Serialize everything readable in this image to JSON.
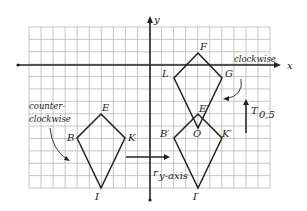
{
  "axes": {
    "x_label": "x",
    "y_label": "y"
  },
  "grid": {
    "left": 29,
    "right": 270,
    "top": 27,
    "bottom": 188,
    "cell": 12,
    "origin_x": 150,
    "origin_y": 65,
    "line_color": "#b8b8b8"
  },
  "figures": {
    "original": {
      "vertices": [
        {
          "name": "E",
          "x": 101,
          "y": 114
        },
        {
          "name": "K",
          "x": 125,
          "y": 138
        },
        {
          "name": "I",
          "x": 101,
          "y": 188
        },
        {
          "name": "B",
          "x": 77,
          "y": 138
        }
      ]
    },
    "reflected": {
      "vertices": [
        {
          "name": "F",
          "x": 198,
          "y": 53
        },
        {
          "name": "G",
          "x": 222,
          "y": 78
        },
        {
          "name": "E'",
          "x": 198,
          "y": 128
        },
        {
          "name": "L",
          "x": 174,
          "y": 78
        }
      ]
    },
    "translated": {
      "vertices": [
        {
          "name": "E'",
          "x": 198,
          "y": 114
        },
        {
          "name": "K'",
          "x": 222,
          "y": 138
        },
        {
          "name": "I'",
          "x": 198,
          "y": 188
        },
        {
          "name": "B'",
          "x": 174,
          "y": 138
        }
      ]
    }
  },
  "labels": {
    "E": "E",
    "B": "B",
    "K": "K",
    "I": "I",
    "F": "F",
    "L": "L",
    "G": "G",
    "E_prime": "E′",
    "O": "O",
    "B_prime": "B′",
    "K_prime": "K′",
    "I_prime": "I′",
    "counter1": "counter-",
    "counter2": "clockwise",
    "clockwise": "clockwise",
    "translation": "T",
    "translation_sub": "0,5",
    "reflection": "r",
    "reflection_sub": "y-axis"
  }
}
